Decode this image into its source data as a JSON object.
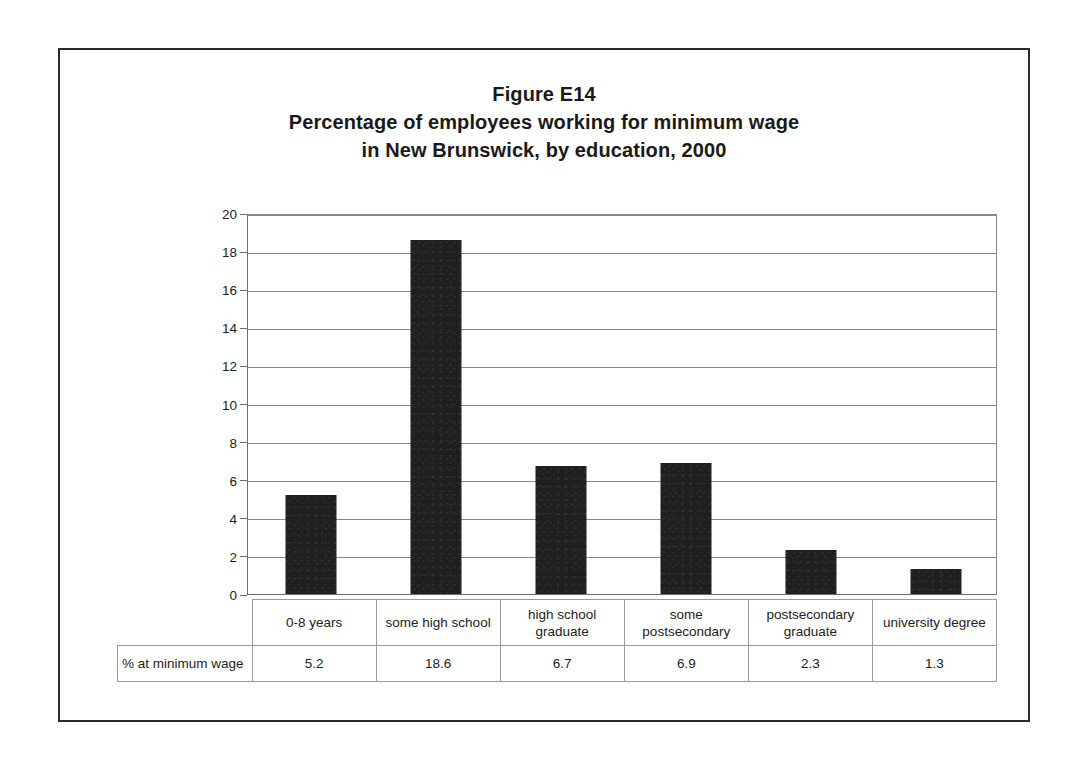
{
  "figure": {
    "title_lines": [
      "Figure E14",
      "Percentage of employees working for minimum wage",
      "in New Brunswick, by education, 2000"
    ],
    "border_color": "#2b2b2b",
    "bar_color": "#201f1f",
    "gridline_color": "#8a8a8a"
  },
  "chart_data": {
    "type": "bar",
    "categories": [
      "0-8 years",
      "some high school",
      "high school graduate",
      "some postsecondary",
      "postsecondary graduate",
      "university degree"
    ],
    "category_lines": [
      [
        "0-8 years"
      ],
      [
        "some high school"
      ],
      [
        "high school",
        "graduate"
      ],
      [
        "some",
        "postsecondary"
      ],
      [
        "postsecondary",
        "graduate"
      ],
      [
        "university degree"
      ]
    ],
    "values": [
      5.2,
      18.6,
      6.7,
      6.9,
      2.3,
      1.3
    ],
    "series_name": "% at minimum wage",
    "xlabel": "",
    "ylabel": "",
    "ylim": [
      0,
      20
    ],
    "yticks": [
      0,
      2,
      4,
      6,
      8,
      10,
      12,
      14,
      16,
      18,
      20
    ],
    "ytick_labels": [
      "0",
      "2",
      "4",
      "6",
      "8",
      "10",
      "12",
      "14",
      "16",
      "18",
      "20"
    ],
    "grid": true,
    "legend": false,
    "data_table_visible": true
  },
  "data_table": {
    "row_header": "% at minimum wage",
    "values": [
      "5.2",
      "18.6",
      "6.7",
      "6.9",
      "2.3",
      "1.3"
    ]
  }
}
